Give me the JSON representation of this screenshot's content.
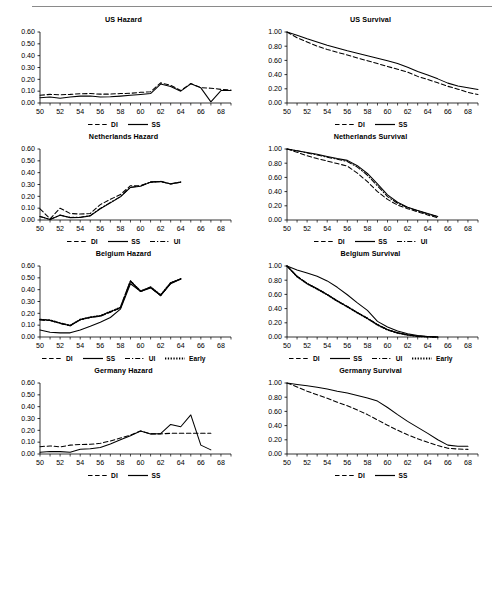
{
  "figure": {
    "has_top_rule": true,
    "panel_count": 8,
    "series_styles": {
      "DI": "dashed",
      "SS": "solid",
      "UI": "dash-dot",
      "Early": "dotted"
    }
  },
  "axes": {
    "x_tick_labels": [
      "50",
      "52",
      "54",
      "56",
      "58",
      "60",
      "62",
      "64",
      "66",
      "68"
    ],
    "x_min": 50,
    "x_max": 69,
    "hazard_y_tick_labels": [
      "0.00",
      "0.10",
      "0.20",
      "0.30",
      "0.40",
      "0.50",
      "0.60"
    ],
    "hazard_ylim": [
      0.0,
      0.6
    ],
    "survival_y_tick_labels": [
      "0.00",
      "0.20",
      "0.40",
      "0.60",
      "0.80",
      "1.00"
    ],
    "survival_ylim": [
      0.0,
      1.0
    ]
  },
  "chart_data": [
    {
      "type": "line",
      "title": "US Hazard",
      "xlabel": "",
      "ylabel": "",
      "xlim": [
        50,
        69
      ],
      "ylim": [
        0.0,
        0.6
      ],
      "grid": false,
      "legend_position": "bottom-center",
      "x": [
        50,
        51,
        52,
        53,
        54,
        55,
        56,
        57,
        58,
        59,
        60,
        61,
        62,
        63,
        64,
        65,
        66,
        67,
        68,
        69
      ],
      "series": [
        {
          "name": "DI",
          "style": "dashed",
          "values": [
            0.065,
            0.073,
            0.07,
            0.073,
            0.078,
            0.08,
            0.075,
            0.075,
            0.08,
            0.082,
            0.09,
            0.095,
            0.17,
            0.15,
            0.105,
            0.165,
            0.13,
            0.125,
            0.115,
            0.11
          ]
        },
        {
          "name": "SS",
          "style": "solid",
          "values": [
            0.045,
            0.05,
            0.04,
            0.05,
            0.058,
            0.06,
            0.05,
            0.052,
            0.058,
            0.065,
            0.072,
            0.08,
            0.16,
            0.14,
            0.1,
            0.162,
            0.128,
            0.01,
            0.105,
            0.105
          ]
        }
      ]
    },
    {
      "type": "line",
      "title": "US Survival",
      "xlabel": "",
      "ylabel": "",
      "xlim": [
        50,
        69
      ],
      "ylim": [
        0.0,
        1.0
      ],
      "grid": false,
      "legend_position": "bottom-center",
      "x": [
        50,
        51,
        52,
        53,
        54,
        55,
        56,
        57,
        58,
        59,
        60,
        61,
        62,
        63,
        64,
        65,
        66,
        67,
        68,
        69
      ],
      "series": [
        {
          "name": "DI",
          "style": "dashed",
          "values": [
            1.0,
            0.92,
            0.86,
            0.8,
            0.755,
            0.715,
            0.675,
            0.635,
            0.595,
            0.555,
            0.515,
            0.475,
            0.435,
            0.375,
            0.33,
            0.285,
            0.235,
            0.195,
            0.15,
            0.12
          ]
        },
        {
          "name": "SS",
          "style": "solid",
          "values": [
            1.0,
            0.955,
            0.905,
            0.86,
            0.815,
            0.775,
            0.735,
            0.7,
            0.665,
            0.63,
            0.595,
            0.555,
            0.505,
            0.445,
            0.395,
            0.34,
            0.28,
            0.24,
            0.215,
            0.19
          ]
        }
      ]
    },
    {
      "type": "line",
      "title": "Netherlands Hazard",
      "xlabel": "",
      "ylabel": "",
      "xlim": [
        50,
        69
      ],
      "ylim": [
        0.0,
        0.6
      ],
      "grid": false,
      "legend_position": "bottom-center",
      "x": [
        50,
        51,
        52,
        53,
        54,
        55,
        56,
        57,
        58,
        59,
        60,
        61,
        62,
        63,
        64
      ],
      "series": [
        {
          "name": "DI",
          "style": "dashed",
          "values": [
            0.095,
            0.01,
            0.1,
            0.055,
            0.05,
            0.055,
            0.13,
            0.175,
            0.215,
            0.29,
            0.29,
            0.32,
            0.325,
            0.305,
            0.32
          ]
        },
        {
          "name": "SS",
          "style": "solid",
          "values": [
            0.03,
            0.005,
            0.04,
            0.02,
            0.022,
            0.035,
            0.095,
            0.145,
            0.195,
            0.275,
            0.285,
            0.32,
            0.325,
            0.305,
            0.32
          ]
        },
        {
          "name": "UI",
          "style": "dash-dot",
          "values": [
            0.03,
            0.005,
            0.042,
            0.022,
            0.024,
            0.037,
            0.098,
            0.148,
            0.198,
            0.277,
            0.287,
            0.322,
            0.327,
            0.307,
            0.322
          ]
        }
      ]
    },
    {
      "type": "line",
      "title": "Netherlands Survival",
      "xlabel": "",
      "ylabel": "",
      "xlim": [
        50,
        69
      ],
      "ylim": [
        0.0,
        1.0
      ],
      "grid": false,
      "legend_position": "bottom-center",
      "x": [
        50,
        51,
        52,
        53,
        54,
        55,
        56,
        57,
        58,
        59,
        60,
        61,
        62,
        63,
        64,
        65
      ],
      "series": [
        {
          "name": "DI",
          "style": "dashed",
          "values": [
            1.0,
            0.955,
            0.905,
            0.865,
            0.83,
            0.795,
            0.76,
            0.66,
            0.54,
            0.4,
            0.29,
            0.21,
            0.16,
            0.115,
            0.07,
            0.03
          ]
        },
        {
          "name": "SS",
          "style": "solid",
          "values": [
            1.0,
            0.975,
            0.95,
            0.925,
            0.895,
            0.865,
            0.84,
            0.765,
            0.655,
            0.51,
            0.355,
            0.25,
            0.18,
            0.135,
            0.09,
            0.05
          ]
        },
        {
          "name": "UI",
          "style": "dash-dot",
          "values": [
            1.0,
            0.975,
            0.945,
            0.915,
            0.885,
            0.855,
            0.825,
            0.745,
            0.63,
            0.48,
            0.33,
            0.235,
            0.175,
            0.13,
            0.085,
            0.045
          ]
        }
      ]
    },
    {
      "type": "line",
      "title": "Belgium Hazard",
      "xlabel": "",
      "ylabel": "",
      "xlim": [
        50,
        69
      ],
      "ylim": [
        0.0,
        0.6
      ],
      "grid": false,
      "legend_position": "bottom-center",
      "x": [
        50,
        51,
        52,
        53,
        54,
        55,
        56,
        57,
        58,
        59,
        60,
        61,
        62,
        63,
        64
      ],
      "series": [
        {
          "name": "DI",
          "style": "dashed",
          "values": [
            0.145,
            0.14,
            0.115,
            0.095,
            0.145,
            0.165,
            0.175,
            0.21,
            0.245,
            0.475,
            0.385,
            0.42,
            0.35,
            0.455,
            0.49
          ]
        },
        {
          "name": "SS",
          "style": "solid",
          "values": [
            0.06,
            0.04,
            0.035,
            0.035,
            0.06,
            0.09,
            0.125,
            0.165,
            0.235,
            0.45,
            0.385,
            0.415,
            0.35,
            0.45,
            0.49
          ]
        },
        {
          "name": "UI",
          "style": "dash-dot",
          "values": [
            0.145,
            0.14,
            0.115,
            0.095,
            0.145,
            0.165,
            0.178,
            0.212,
            0.247,
            0.47,
            0.385,
            0.42,
            0.352,
            0.455,
            0.49
          ]
        },
        {
          "name": "Early",
          "style": "dotted",
          "values": [
            0.148,
            0.143,
            0.118,
            0.098,
            0.148,
            0.168,
            0.18,
            0.215,
            0.25,
            0.472,
            0.388,
            0.422,
            0.355,
            0.458,
            0.492
          ]
        }
      ]
    },
    {
      "type": "line",
      "title": "Belgium Survival",
      "xlabel": "",
      "ylabel": "",
      "xlim": [
        50,
        69
      ],
      "ylim": [
        0.0,
        1.0
      ],
      "grid": false,
      "legend_position": "bottom-center",
      "x": [
        50,
        51,
        52,
        53,
        54,
        55,
        56,
        57,
        58,
        59,
        60,
        61,
        62,
        63,
        64,
        65
      ],
      "series": [
        {
          "name": "DI",
          "style": "dashed",
          "values": [
            1.0,
            0.855,
            0.755,
            0.68,
            0.6,
            0.51,
            0.43,
            0.345,
            0.265,
            0.175,
            0.105,
            0.06,
            0.03,
            0.012,
            0.004,
            0.0
          ]
        },
        {
          "name": "SS",
          "style": "solid",
          "values": [
            1.0,
            0.945,
            0.9,
            0.855,
            0.79,
            0.7,
            0.595,
            0.48,
            0.375,
            0.22,
            0.14,
            0.085,
            0.045,
            0.02,
            0.006,
            0.0
          ]
        },
        {
          "name": "UI",
          "style": "dash-dot",
          "values": [
            1.0,
            0.855,
            0.755,
            0.68,
            0.6,
            0.51,
            0.43,
            0.345,
            0.265,
            0.175,
            0.105,
            0.06,
            0.03,
            0.012,
            0.004,
            0.0
          ]
        },
        {
          "name": "Early",
          "style": "dotted",
          "values": [
            1.0,
            0.85,
            0.75,
            0.675,
            0.595,
            0.505,
            0.425,
            0.34,
            0.26,
            0.17,
            0.1,
            0.055,
            0.028,
            0.01,
            0.003,
            0.0
          ]
        }
      ]
    },
    {
      "type": "line",
      "title": "Germany Hazard",
      "xlabel": "",
      "ylabel": "",
      "xlim": [
        50,
        69
      ],
      "ylim": [
        0.0,
        0.6
      ],
      "grid": false,
      "legend_position": "bottom-center",
      "x": [
        50,
        51,
        52,
        53,
        54,
        55,
        56,
        57,
        58,
        59,
        60,
        61,
        62,
        63,
        64,
        65,
        66,
        67
      ],
      "series": [
        {
          "name": "DI",
          "style": "dashed",
          "values": [
            0.062,
            0.068,
            0.06,
            0.075,
            0.08,
            0.082,
            0.09,
            0.11,
            0.135,
            0.16,
            0.195,
            0.17,
            0.17,
            0.175,
            0.175,
            0.175,
            0.175,
            0.175
          ]
        },
        {
          "name": "SS",
          "style": "solid",
          "values": [
            0.015,
            0.022,
            0.02,
            0.015,
            0.04,
            0.045,
            0.055,
            0.085,
            0.12,
            0.155,
            0.195,
            0.17,
            0.172,
            0.25,
            0.23,
            0.33,
            0.075,
            0.035
          ]
        }
      ]
    },
    {
      "type": "line",
      "title": "Germany Survival",
      "xlabel": "",
      "ylabel": "",
      "xlim": [
        50,
        69
      ],
      "ylim": [
        0.0,
        1.0
      ],
      "grid": false,
      "legend_position": "bottom-center",
      "x": [
        50,
        51,
        52,
        53,
        54,
        55,
        56,
        57,
        58,
        59,
        60,
        61,
        62,
        63,
        64,
        65,
        66,
        67,
        68
      ],
      "series": [
        {
          "name": "DI",
          "style": "dashed",
          "values": [
            1.0,
            0.945,
            0.885,
            0.835,
            0.785,
            0.73,
            0.68,
            0.62,
            0.555,
            0.48,
            0.405,
            0.335,
            0.27,
            0.215,
            0.165,
            0.12,
            0.08,
            0.07,
            0.065
          ]
        },
        {
          "name": "SS",
          "style": "solid",
          "values": [
            1.0,
            0.98,
            0.96,
            0.94,
            0.915,
            0.885,
            0.86,
            0.825,
            0.79,
            0.745,
            0.655,
            0.555,
            0.46,
            0.375,
            0.29,
            0.2,
            0.125,
            0.11,
            0.11
          ]
        }
      ]
    }
  ]
}
